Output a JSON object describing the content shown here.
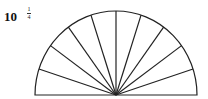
{
  "problem": {
    "number": "10",
    "fraction": {
      "numerator": "1",
      "denominator": "4"
    }
  },
  "figure": {
    "shape": "semicircle",
    "sectors": 10,
    "center": [
      116,
      95
    ],
    "rx": 81,
    "ry": 84,
    "stroke": "#222222"
  }
}
